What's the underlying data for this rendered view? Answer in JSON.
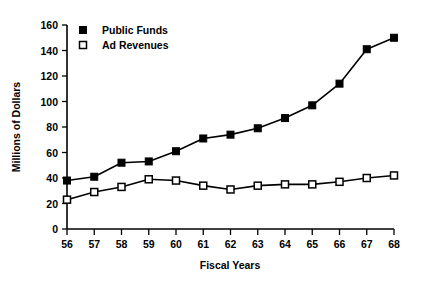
{
  "chart_data": {
    "type": "line",
    "title": "",
    "xlabel": "Fiscal Years",
    "ylabel": "Millions of Dollars",
    "categories": [
      "56",
      "57",
      "58",
      "59",
      "60",
      "61",
      "62",
      "63",
      "64",
      "65",
      "66",
      "67",
      "68"
    ],
    "x": [
      56,
      57,
      58,
      59,
      60,
      61,
      62,
      63,
      64,
      65,
      66,
      67,
      68
    ],
    "xlim": [
      56,
      68
    ],
    "ylim": [
      0,
      160
    ],
    "ytick_values": [
      0,
      20,
      40,
      60,
      80,
      100,
      120,
      140,
      160
    ],
    "ytick_labels": [
      "0",
      "20",
      "40",
      "60",
      "80",
      "100",
      "120",
      "140",
      "160"
    ],
    "xtick_labels": [
      "56",
      "57",
      "58",
      "59",
      "60",
      "61",
      "62",
      "63",
      "64",
      "65",
      "66",
      "67",
      "68"
    ],
    "grid": false,
    "legend_position": "top-left",
    "series": [
      {
        "name": "Public Funds",
        "marker": "filled-square",
        "color": "#000000",
        "values": [
          38,
          41,
          52,
          53,
          61,
          71,
          74,
          79,
          87,
          97,
          114,
          141,
          150
        ]
      },
      {
        "name": "Ad Revenues",
        "marker": "open-square",
        "color": "#000000",
        "values": [
          23,
          29,
          33,
          39,
          38,
          34,
          31,
          34,
          35,
          35,
          37,
          40,
          42
        ]
      }
    ]
  },
  "legend": {
    "entries": [
      {
        "label": "Public Funds",
        "marker": "filled-square"
      },
      {
        "label": "Ad Revenues",
        "marker": "open-square"
      }
    ]
  },
  "axes": {
    "y_title": "Millions of Dollars",
    "x_title": "Fiscal Years"
  }
}
